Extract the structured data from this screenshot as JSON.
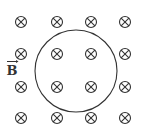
{
  "diagram": {
    "field_label": "B",
    "field_direction": "into-page",
    "symbol": "⊗",
    "grid": {
      "rows": 4,
      "cols": 4,
      "x": [
        21,
        57,
        91,
        125
      ],
      "y": [
        22,
        54,
        87,
        118
      ]
    },
    "loop": {
      "cx": 76,
      "cy": 71,
      "r": 41
    },
    "colors": {
      "stroke": "#333333"
    }
  }
}
